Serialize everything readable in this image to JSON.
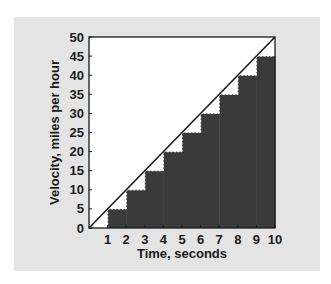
{
  "chart_data": {
    "type": "area",
    "title": "",
    "xlabel": "Time, seconds",
    "ylabel": "Velocity, miles per hour",
    "xlim": [
      0,
      10
    ],
    "ylim": [
      0,
      50
    ],
    "x_ticks": [
      "1",
      "2",
      "3",
      "4",
      "5",
      "6",
      "7",
      "8",
      "9",
      "10"
    ],
    "y_ticks": [
      "0",
      "5",
      "10",
      "15",
      "20",
      "25",
      "30",
      "35",
      "40",
      "45",
      "50"
    ],
    "grid": false,
    "legend": null,
    "series": [
      {
        "name": "Velocity (continuous)",
        "type": "line",
        "x": [
          0,
          10
        ],
        "values": [
          0,
          50
        ]
      },
      {
        "name": "Velocity (step approximation)",
        "type": "step-area",
        "x_start": [
          1,
          2,
          3,
          4,
          5,
          6,
          7,
          8,
          9
        ],
        "x_end": [
          2,
          3,
          4,
          5,
          6,
          7,
          8,
          9,
          10
        ],
        "values": [
          5,
          10,
          15,
          20,
          25,
          30,
          35,
          40,
          45
        ]
      }
    ],
    "colors": {
      "background_panel": "#e4e4e4",
      "plot_background": "#ffffff",
      "step_fill": "#3a3a3a",
      "line": "#1a1a1a",
      "dashed_edge": "#ffffff"
    }
  }
}
